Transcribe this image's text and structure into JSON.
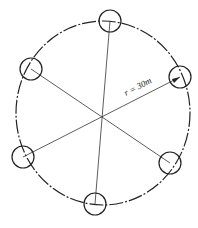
{
  "diagram": {
    "title": "",
    "radius_label": "r = 30m",
    "center": {
      "x": 103,
      "y": 115
    },
    "outer_circle": {
      "rx": 87,
      "ry": 92,
      "style": "dash-dot",
      "color": "#222222"
    },
    "nodes": [
      {
        "id": "node-top",
        "x": 110,
        "y": 21,
        "r": 11
      },
      {
        "id": "node-upper-right",
        "x": 180,
        "y": 77,
        "r": 11
      },
      {
        "id": "node-lower-right",
        "x": 170,
        "y": 163,
        "r": 11
      },
      {
        "id": "node-bottom",
        "x": 95,
        "y": 204,
        "r": 11
      },
      {
        "id": "node-lower-left",
        "x": 23,
        "y": 157,
        "r": 11
      },
      {
        "id": "node-upper-left",
        "x": 31,
        "y": 69,
        "r": 11
      }
    ],
    "line_color": "#333333"
  }
}
